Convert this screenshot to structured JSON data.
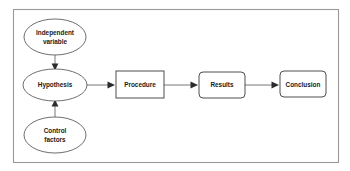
{
  "diagram": {
    "background_color": "#ffffff",
    "frame": {
      "name": "outer-frame",
      "border_color": "#9a9a9a"
    },
    "nodes": [
      {
        "id": "independent-variable",
        "label_line1": "Independent",
        "label_line2": "variable",
        "shape": "ellipse",
        "cx": 55,
        "cy": 37,
        "rx": 31,
        "ry": 18
      },
      {
        "id": "hypothesis",
        "label_line1": "Hypothesis",
        "label_line2": "",
        "shape": "ellipse",
        "cx": 55,
        "cy": 85,
        "rx": 32,
        "ry": 16
      },
      {
        "id": "control-factors",
        "label_line1": "Control",
        "label_line2": "factors",
        "shape": "ellipse",
        "cx": 55,
        "cy": 135,
        "rx": 31,
        "ry": 18
      },
      {
        "id": "procedure",
        "label_line1": "Procedure",
        "label_line2": "",
        "shape": "rect",
        "x": 116,
        "y": 71,
        "width": 48,
        "height": 27,
        "corner_radius": 0
      },
      {
        "id": "results",
        "label_line1": "Results",
        "label_line2": "",
        "shape": "rect",
        "x": 199,
        "y": 72,
        "width": 46,
        "height": 26,
        "corner_radius": 4
      },
      {
        "id": "conclusion",
        "label_line1": "Conclusion",
        "label_line2": "",
        "shape": "rect",
        "x": 280,
        "y": 71,
        "width": 46,
        "height": 26,
        "corner_radius": 4
      }
    ],
    "connectors": [
      {
        "id": "independent-variable-to-hypothesis",
        "from": "independent-variable",
        "to": "hypothesis",
        "direction": "down"
      },
      {
        "id": "control-factors-to-hypothesis",
        "from": "control-factors",
        "to": "hypothesis",
        "direction": "up"
      },
      {
        "id": "hypothesis-to-procedure",
        "from": "hypothesis",
        "to": "procedure",
        "direction": "right"
      },
      {
        "id": "procedure-to-results",
        "from": "procedure",
        "to": "results",
        "direction": "right"
      },
      {
        "id": "results-to-conclusion",
        "from": "results",
        "to": "conclusion",
        "direction": "right"
      }
    ]
  }
}
